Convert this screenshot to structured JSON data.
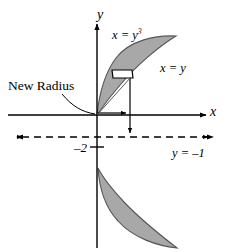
{
  "figure": {
    "type": "math-diagram",
    "width": 233,
    "height": 252,
    "colors": {
      "background": "#ffffff",
      "ink": "#000000",
      "region_fill": "#a8a8a8",
      "region_stroke": "#4d4d4d",
      "rectangle_fill": "#ffffff",
      "rectangle_stroke": "#000000"
    }
  },
  "axes": {
    "x_axis_label": "x",
    "y_axis_label": "y",
    "origin": {
      "x": 97,
      "y": 115
    },
    "x_axis_arrow": "right",
    "y_axis_arrow": "up",
    "ticks": [
      {
        "label": "–2",
        "value": -2,
        "axis": "y",
        "position": {
          "x": 97,
          "y": 147
        }
      }
    ]
  },
  "curves": [
    {
      "name": "cubic-curve",
      "label": "x = y",
      "label_exponent": "3",
      "equation": "x = y^3"
    },
    {
      "name": "line-curve",
      "label": "x = y",
      "equation": "x = y"
    }
  ],
  "annotations": {
    "new_radius": {
      "label": "New Radius",
      "leader": "curved arrow from label to representative rectangle radius"
    },
    "axis_of_revolution": {
      "label": "y = –1",
      "equation": "y = -1",
      "style": "dashed horizontal line with arrows both ends"
    }
  },
  "elements": {
    "representative_rectangle": "white rectangle perpendicular to the line x = y inside the shaded region",
    "radius_arrow": "horizontal arrow from origin to the right",
    "drop_line": "vertical arrow from rectangle down to the line y = -1",
    "upper_region": "shaded lens between x = y^3 and x = y for 0 <= y <= 1",
    "lower_region": "shaded lens between x = y^3 and x = y for -1 <= y <= 0"
  }
}
